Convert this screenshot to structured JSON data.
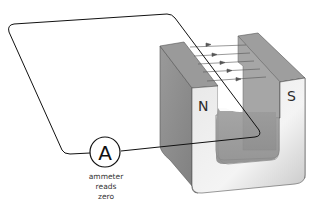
{
  "diagram": {
    "magnet": {
      "north_label": "N",
      "south_label": "S",
      "field_lines": 5,
      "colors": {
        "dark": "#8c8c8c",
        "mid": "#a8a8a8",
        "light": "#e2e2e2",
        "inner": "#9a9a9a"
      }
    },
    "ammeter": {
      "symbol": "A",
      "caption_lines": [
        "ammeter",
        "reads",
        "zero"
      ]
    },
    "wire_color": "#111111"
  }
}
